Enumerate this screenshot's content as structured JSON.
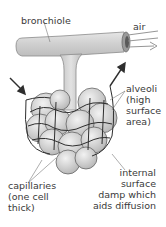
{
  "diagram": {
    "labels": {
      "bronchiole": "bronchiole",
      "air": "air",
      "alveoli": [
        "alveoli",
        "(high",
        "surface",
        "area)"
      ],
      "capillaries": [
        "capillaries",
        "(one cell",
        "thick)"
      ],
      "internal_surface": [
        "internal",
        "surface",
        "damp which",
        "aids diffusion"
      ]
    },
    "colors": {
      "tube_fill": "#d4d4d4",
      "tube_stroke": "#8a8a8a",
      "alveoli_fill": "#cfcfcf",
      "capillary_stroke": "#2e2e2e",
      "arrow": "#2e2e2e",
      "text": "#3a3a3a"
    }
  }
}
